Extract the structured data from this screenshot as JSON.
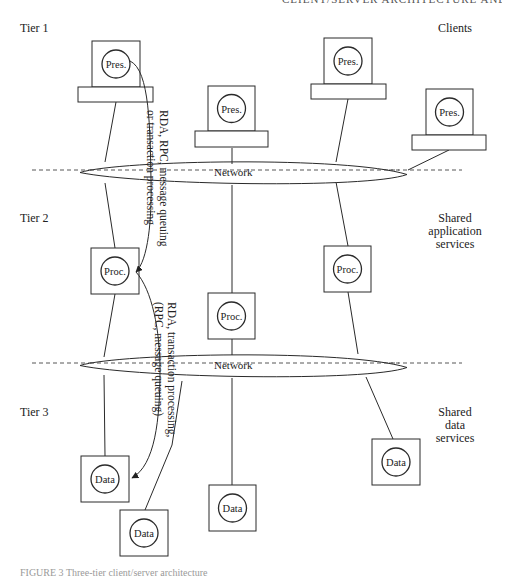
{
  "header": {
    "text": "CLIENT/SERVER ARCHITECTURE AND DATABASE 7"
  },
  "tiers": [
    {
      "label": "Tier 1",
      "x": 20,
      "y": 22
    },
    {
      "label": "Tier 2",
      "x": 20,
      "y": 212
    },
    {
      "label": "Tier 3",
      "x": 20,
      "y": 406
    }
  ],
  "right_labels": [
    {
      "lines": [
        "Clients"
      ],
      "x": 415,
      "y": 22
    },
    {
      "lines": [
        "Shared",
        "application",
        "services"
      ],
      "x": 415,
      "y": 212
    },
    {
      "lines": [
        "Shared",
        "data",
        "services"
      ],
      "x": 415,
      "y": 406
    }
  ],
  "networks": [
    {
      "label": "Network",
      "dashed_y": 170,
      "label_x": 214,
      "label_y": 176,
      "ellipse": {
        "left": 80,
        "right": 407,
        "top": 160,
        "bottom": 185
      }
    },
    {
      "label": "Network",
      "dashed_y": 363,
      "label_x": 214,
      "label_y": 369,
      "ellipse": {
        "left": 80,
        "right": 407,
        "top": 353,
        "bottom": 378
      }
    }
  ],
  "clients": [
    {
      "label": "Pres.",
      "box": [
        92,
        41,
        48,
        46
      ],
      "base": [
        78,
        87,
        75,
        15
      ]
    },
    {
      "label": "Pres.",
      "box": [
        208,
        86,
        47,
        45
      ],
      "base": [
        195,
        131,
        73,
        16
      ]
    },
    {
      "label": "Pres.",
      "box": [
        324,
        38,
        48,
        46
      ],
      "base": [
        311,
        84,
        75,
        15
      ]
    },
    {
      "label": "Pres.",
      "box": [
        426,
        89,
        47,
        46
      ],
      "base": [
        412,
        135,
        74,
        15
      ]
    }
  ],
  "app_servers": [
    {
      "label": "Proc.",
      "box": [
        91,
        248,
        48,
        46
      ]
    },
    {
      "label": "Proc.",
      "box": [
        324,
        246,
        47,
        46
      ]
    },
    {
      "label": "Proc.",
      "box": [
        208,
        293,
        47,
        46
      ]
    }
  ],
  "data_servers": [
    {
      "label": "Data",
      "box": [
        81,
        456,
        48,
        46
      ]
    },
    {
      "label": "Data",
      "box": [
        120,
        510,
        48,
        46
      ]
    },
    {
      "label": "Data",
      "box": [
        209,
        485,
        47,
        46
      ]
    },
    {
      "label": "Data",
      "box": [
        372,
        439,
        48,
        46
      ]
    }
  ],
  "connectors": [
    {
      "from": [
        116,
        102
      ],
      "to": [
        105,
        162
      ]
    },
    {
      "from": [
        232,
        148
      ],
      "to": [
        232,
        164
      ]
    },
    {
      "from": [
        348,
        99
      ],
      "to": [
        336,
        162
      ]
    },
    {
      "from": [
        449,
        150
      ],
      "to": [
        408,
        170
      ]
    },
    {
      "from": [
        105,
        183
      ],
      "to": [
        115,
        248
      ]
    },
    {
      "from": [
        232,
        185
      ],
      "to": [
        232,
        293
      ]
    },
    {
      "from": [
        336,
        182
      ],
      "to": [
        348,
        246
      ]
    },
    {
      "from": [
        115,
        294
      ],
      "to": [
        104,
        357
      ]
    },
    {
      "from": [
        232,
        339
      ],
      "to": [
        232,
        355
      ]
    },
    {
      "from": [
        348,
        292
      ],
      "to": [
        358,
        354
      ]
    },
    {
      "from": [
        104,
        375
      ],
      "to": [
        105,
        456
      ]
    },
    {
      "from": [
        232,
        378
      ],
      "to": [
        232,
        485
      ]
    },
    {
      "from": [
        366,
        377
      ],
      "to": [
        393,
        439
      ]
    },
    {
      "from": [
        182,
        381
      ],
      "to": [
        172,
        445
      ]
    },
    {
      "from": [
        172,
        445
      ],
      "to": [
        145,
        510
      ]
    }
  ],
  "flows": [
    {
      "name": "tier1-to-tier2-flow",
      "path": "M 130 61 C 150 70, 150 130, 151 180 C 152 220, 148 260, 136 272",
      "text_lines": [
        "RDA, RPC, message queuing",
        "or transaction processing"
      ],
      "text_x": 160,
      "text_y": 110
    },
    {
      "name": "tier2-to-tier3-flow",
      "path": "M 136 272 C 152 290, 160 330, 160 370 C 160 420, 155 465, 132 478",
      "text_lines": [
        "RDA, transaction processing,",
        "(RPC, message queuing)"
      ],
      "text_x": 168,
      "text_y": 302
    }
  ],
  "caption": {
    "text": "FIGURE 3 Three-tier client/server architecture"
  },
  "colors": {
    "stroke": "#2a2a2a",
    "background": "#ffffff",
    "dash": "#444444"
  }
}
